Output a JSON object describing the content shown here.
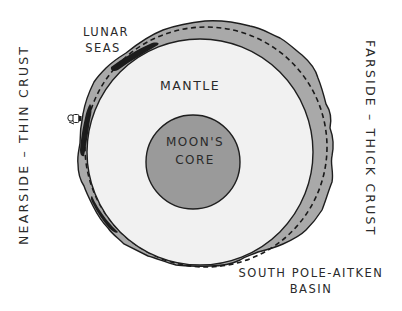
{
  "diagram": {
    "labels": {
      "lunar_seas_line1": "LUNAR",
      "lunar_seas_line2": "SEAS",
      "mantle": "MANTLE",
      "core_line1": "MOON'S",
      "core_line2": "CORE",
      "nearside": "NEARSIDE – THIN CRUST",
      "farside": "FARSIDE – THICK CRUST",
      "basin_line1": "SOUTH POLE-AITKEN",
      "basin_line2": "BASIN"
    },
    "layers": [
      {
        "name": "crust",
        "fill": "#a9a9a9"
      },
      {
        "name": "mantle",
        "fill": "#f1f1f1"
      },
      {
        "name": "core",
        "fill": "#9a9a9a"
      },
      {
        "name": "lunar-seas",
        "fill": "#1c1c1c"
      }
    ],
    "icons": [
      "astronaut-icon"
    ],
    "colors": {
      "background": "#ffffff",
      "outline": "#1e1e1e",
      "text": "#2a2a2a"
    }
  }
}
